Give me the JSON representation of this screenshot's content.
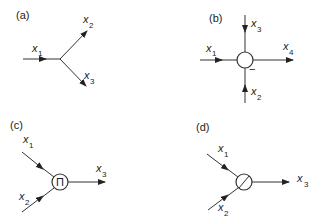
{
  "panels": {
    "a": {
      "label": "(a)",
      "type": "branch-point",
      "inputs": [
        {
          "var": "x",
          "sub": "1"
        }
      ],
      "outputs": [
        {
          "var": "x",
          "sub": "2"
        },
        {
          "var": "x",
          "sub": "3"
        }
      ]
    },
    "b": {
      "label": "(b)",
      "type": "summing-junction",
      "inputs": [
        {
          "var": "x",
          "sub": "1"
        },
        {
          "var": "x",
          "sub": "3"
        },
        {
          "var": "x",
          "sub": "2"
        }
      ],
      "outputs": [
        {
          "var": "x",
          "sub": "4"
        }
      ],
      "sign": "−"
    },
    "c": {
      "label": "(c)",
      "type": "multiplier",
      "node_symbol": "Π",
      "inputs": [
        {
          "var": "x",
          "sub": "1"
        },
        {
          "var": "x",
          "sub": "2"
        }
      ],
      "outputs": [
        {
          "var": "x",
          "sub": "3"
        }
      ]
    },
    "d": {
      "label": "(d)",
      "type": "divider",
      "node_symbol": "/",
      "inputs": [
        {
          "var": "x",
          "sub": "1"
        },
        {
          "var": "x",
          "sub": "2"
        }
      ],
      "outputs": [
        {
          "var": "x",
          "sub": "3"
        }
      ]
    }
  }
}
